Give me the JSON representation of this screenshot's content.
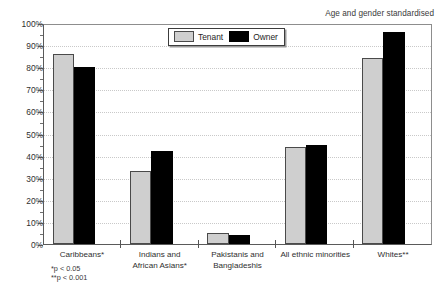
{
  "annotation": "Age and gender standardised",
  "legend": {
    "items": [
      {
        "label": "Tenant",
        "color": "#cfcfcf",
        "swatch": "tenant-swatch"
      },
      {
        "label": "Owner",
        "color": "#000000",
        "swatch": "owner-swatch"
      }
    ]
  },
  "footnotes": [
    "*p < 0.05",
    "**p < 0.001"
  ],
  "yaxis": {
    "ticks": [
      "0%",
      "10%",
      "20%",
      "30%",
      "40%",
      "50%",
      "60%",
      "70%",
      "80%",
      "90%",
      "100%"
    ]
  },
  "xaxis": {
    "labels": [
      {
        "line1": "Caribbeans*",
        "line2": ""
      },
      {
        "line1": "Indians and",
        "line2": "African Asians*"
      },
      {
        "line1": "Pakistanis and",
        "line2": "Bangladeshis"
      },
      {
        "line1": "All ethnic minorities",
        "line2": ""
      },
      {
        "line1": "Whites**",
        "line2": ""
      }
    ]
  },
  "chart_data": {
    "type": "bar",
    "title": "",
    "subtitle": "",
    "xlabel": "",
    "ylabel": "",
    "ylim": [
      0,
      100
    ],
    "ytick_step": 10,
    "yminor_step": 5,
    "grid": true,
    "legend_position": "top-center",
    "annotation": "Age and gender standardised",
    "categories": [
      "Caribbeans*",
      "Indians and African Asians*",
      "Pakistanis and Bangladeshis",
      "All ethnic minorities",
      "Whites**"
    ],
    "series": [
      {
        "name": "Tenant",
        "color": "#cfcfcf",
        "values": [
          86,
          33,
          5,
          44,
          84
        ]
      },
      {
        "name": "Owner",
        "color": "#000000",
        "values": [
          80,
          42,
          4,
          45,
          96
        ]
      }
    ],
    "footnotes": [
      "*p < 0.05",
      "**p < 0.001"
    ]
  }
}
